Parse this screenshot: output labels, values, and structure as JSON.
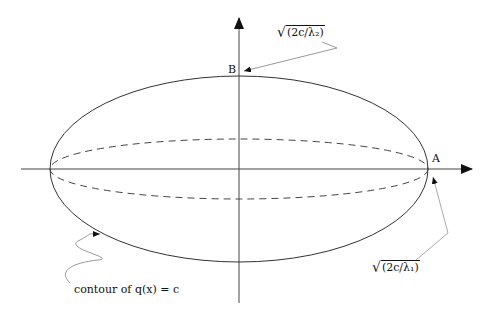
{
  "diagram": {
    "point_labels": {
      "A": "A",
      "B": "B"
    },
    "annotations": {
      "lambda2_label": "(2c/λ₂)",
      "lambda1_label": "(2c/λ₁)",
      "sqrt_symbol": "√",
      "contour_label": "contour of q(x) = c"
    },
    "geometry": {
      "center": [
        239,
        169
      ],
      "outer_ellipse": {
        "rx": 189,
        "ry": 93,
        "style": "solid"
      },
      "inner_ellipse": {
        "rx": 189,
        "ry": 30,
        "style": "dashed"
      },
      "x_axis": {
        "from": 21,
        "to": 472
      },
      "y_axis": {
        "from": 303,
        "to": 18
      }
    },
    "colors": {
      "stroke": "#333333",
      "leader": "#999999"
    }
  }
}
